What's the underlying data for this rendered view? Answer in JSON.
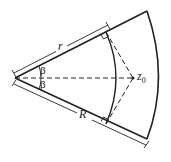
{
  "diagram": {
    "type": "geometry",
    "labels": {
      "inner_radius": "r",
      "outer_radius": "R",
      "angle_upper": "β",
      "angle_lower": "β",
      "point": "z",
      "point_subscript": "0"
    },
    "colors": {
      "stroke": "#222222",
      "background": "#ffffff"
    }
  }
}
